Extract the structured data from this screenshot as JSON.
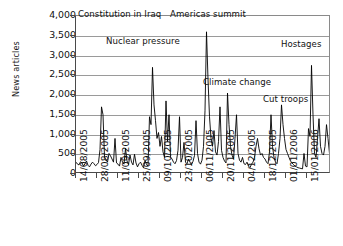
{
  "chart_data": {
    "type": "line",
    "title": "",
    "xlabel": "",
    "ylabel": "News articles",
    "ylim": [
      0,
      4000
    ],
    "ytick_labels": [
      "4,000",
      "3,500",
      "3,000",
      "2,500",
      "2,000",
      "1,500",
      "1,000",
      "500",
      "0"
    ],
    "ytick_values": [
      4000,
      3500,
      3000,
      2500,
      2000,
      1500,
      1000,
      500,
      0
    ],
    "grid": true,
    "legend": "none",
    "xtick_labels": [
      "14/08/2005",
      "28/08/2005",
      "11/09/2005",
      "25/09/2005",
      "09/10/2005",
      "23/10/2005",
      "06/11/2005",
      "20/11/2005",
      "04/12/2005",
      "18/12/2005",
      "01/01/2006",
      "15/01/2006"
    ],
    "xtick_index": [
      0,
      14,
      28,
      42,
      56,
      70,
      84,
      98,
      112,
      126,
      140,
      154
    ],
    "series": [
      {
        "name": "News articles",
        "color": "#000000",
        "values": [
          300,
          250,
          230,
          310,
          280,
          200,
          260,
          330,
          220,
          180,
          250,
          300,
          260,
          210,
          240,
          290,
          620,
          1700,
          1500,
          430,
          360,
          300,
          520,
          460,
          380,
          300,
          900,
          280,
          250,
          200,
          420,
          300,
          250,
          650,
          330,
          240,
          480,
          300,
          230,
          500,
          280,
          180,
          260,
          300,
          220,
          160,
          340,
          240,
          200,
          1450,
          1250,
          2700,
          1750,
          1350,
          900,
          1050,
          700,
          950,
          560,
          420,
          1850,
          820,
          1500,
          430,
          380,
          300,
          260,
          340,
          600,
          1450,
          300,
          420,
          800,
          300,
          260,
          380,
          300,
          240,
          320,
          470,
          1350,
          520,
          300,
          250,
          350,
          700,
          1600,
          3600,
          2400,
          1450,
          900,
          700,
          1100,
          560,
          480,
          820,
          1700,
          600,
          420,
          330,
          280,
          2050,
          1250,
          700,
          480,
          380,
          900,
          1500,
          520,
          350,
          300,
          420,
          260,
          240,
          300,
          200,
          160,
          250,
          300,
          420,
          700,
          900,
          640,
          480,
          520,
          420,
          380,
          300,
          260,
          560,
          1500,
          700,
          420,
          300,
          260,
          520,
          900,
          1750,
          1250,
          900,
          620,
          520,
          420,
          330,
          280,
          240,
          200,
          180,
          160,
          150,
          140,
          130,
          520,
          200,
          180,
          1150,
          950,
          2750,
          1500,
          520,
          420,
          900,
          1400,
          700,
          520,
          480,
          700,
          1250,
          900,
          520,
          380
        ]
      }
    ],
    "annotations": [
      {
        "label": "Constitution in Iraq",
        "x": 78,
        "y": 10,
        "leader_x": 120,
        "leader_top": 18,
        "leader_bottom": 110
      },
      {
        "label": "Americas summit",
        "x": 170,
        "y": 10,
        "leader_x": 213,
        "leader_top": 18,
        "leader_bottom": 24
      },
      {
        "label": "Nuclear pressure",
        "x": 106,
        "y": 37,
        "leader_x": 149,
        "leader_top": 45,
        "leader_bottom": 62
      },
      {
        "label": "Hostages",
        "x": 281,
        "y": 40,
        "leader_x": 0,
        "leader_top": 0,
        "leader_bottom": 0
      },
      {
        "label": "Climate change",
        "x": 203,
        "y": 78,
        "leader_x": 0,
        "leader_top": 0,
        "leader_bottom": 0
      },
      {
        "label": "Cut troops",
        "x": 263,
        "y": 95,
        "leader_x": 0,
        "leader_top": 0,
        "leader_bottom": 0
      }
    ]
  }
}
